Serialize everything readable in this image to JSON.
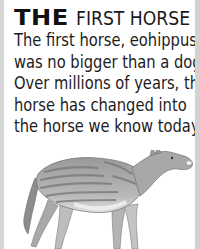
{
  "heading": {
    "prefix": "THE",
    "title": "FIRST HORSE"
  },
  "body": {
    "lines": [
      "The first horse, eohippus,",
      "was no bigger than a dog.",
      "Over millions of years, the",
      "horse has changed into",
      "the horse we know today."
    ]
  },
  "illustration": {
    "subject": "eohippus",
    "description": "Grayscale drawing of a small striped early horse (eohippus) facing right"
  },
  "colors": {
    "background": "#ffffff",
    "text": "#1c1c1c",
    "frame": "#d4d4d4"
  }
}
